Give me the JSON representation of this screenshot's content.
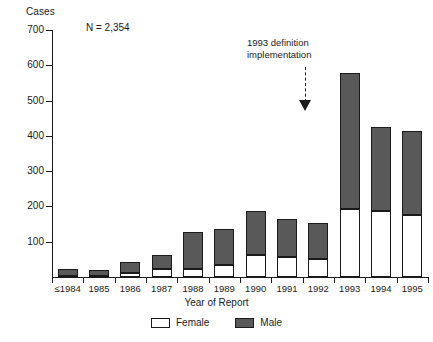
{
  "chart_data": {
    "type": "bar",
    "subtype": "stacked-bar",
    "title": "",
    "xlabel": "Year of Report",
    "ylabel": "Cases",
    "ylim": [
      0,
      700
    ],
    "yticks": [
      0,
      100,
      200,
      300,
      400,
      500,
      600,
      700
    ],
    "ytick_labels": [
      "",
      "100",
      "200",
      "300",
      "400",
      "500",
      "600",
      "700"
    ],
    "grid": false,
    "legend_position": "bottom-center",
    "categories": [
      "≤1984",
      "1985",
      "1986",
      "1987",
      "1988",
      "1989",
      "1990",
      "1991",
      "1992",
      "1993",
      "1994",
      "1995"
    ],
    "series": [
      {
        "name": "Female",
        "color": "#ffffff",
        "values": [
          4,
          3,
          10,
          22,
          23,
          35,
          62,
          58,
          50,
          193,
          186,
          175
        ]
      },
      {
        "name": "Male",
        "color": "#595959",
        "values": [
          20,
          18,
          34,
          41,
          105,
          100,
          124,
          107,
          102,
          385,
          239,
          240
        ]
      }
    ],
    "totals": [
      24,
      21,
      44,
      63,
      128,
      135,
      186,
      165,
      152,
      578,
      425,
      415
    ],
    "annotations": [
      {
        "name": "sample-size",
        "text": "N = 2,354"
      },
      {
        "name": "definition-change",
        "text": "1993 definition\nimplementation",
        "points_to": "1993"
      }
    ]
  },
  "legend": {
    "items": [
      {
        "label": "Female",
        "color": "#ffffff"
      },
      {
        "label": "Male",
        "color": "#595959"
      }
    ]
  }
}
